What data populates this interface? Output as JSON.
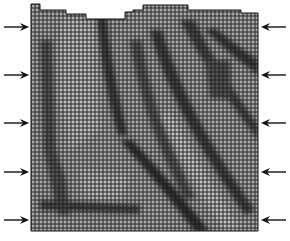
{
  "figure": {
    "mesh": {
      "x0": 31,
      "x1": 258,
      "y_bottom": 231,
      "cell_size": 4,
      "top_profile": [
        {
          "x0": 31,
          "x1": 40,
          "y": 4
        },
        {
          "x0": 40,
          "x1": 66,
          "y": 10
        },
        {
          "x0": 66,
          "x1": 86,
          "y": 14
        },
        {
          "x0": 86,
          "x1": 125,
          "y": 19
        },
        {
          "x0": 125,
          "x1": 133,
          "y": 12
        },
        {
          "x0": 133,
          "x1": 143,
          "y": 10
        },
        {
          "x0": 143,
          "x1": 188,
          "y": 5
        },
        {
          "x0": 188,
          "x1": 241,
          "y": 10
        },
        {
          "x0": 241,
          "x1": 258,
          "y": 13
        }
      ],
      "colors": {
        "light": "#b8b8b8",
        "mid": "#8a8a8a",
        "dark": "#2a2a2a",
        "grid": "#1a1a1a"
      }
    },
    "arrows": {
      "left": [
        27,
        75,
        123,
        172,
        220
      ],
      "right": [
        27,
        75,
        123,
        172,
        220
      ],
      "color": "#111111"
    }
  }
}
